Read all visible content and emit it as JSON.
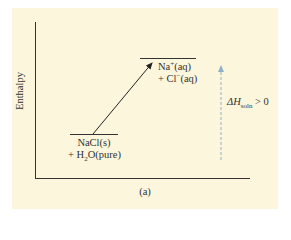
{
  "diagram": {
    "y_axis_label": "Enthalpy",
    "caption": "(a)",
    "lower_level": {
      "line1": "NaCl(s)",
      "line2_prefix": "+ H",
      "line2_sub": "2",
      "line2_suffix": "O(pure)"
    },
    "upper_level": {
      "line1_prefix": "Na",
      "line1_sup": "+",
      "line1_suffix": "(aq)",
      "line2_prefix": "+ Cl",
      "line2_sup": "−",
      "line2_suffix": "(aq)"
    },
    "delta_label": {
      "symbol": "ΔH",
      "sub": "soln",
      "relation": " > 0"
    },
    "colors": {
      "background": "#fcf6dc",
      "axis": "#333333",
      "dashed_arrow": "#8fb0c8"
    }
  }
}
